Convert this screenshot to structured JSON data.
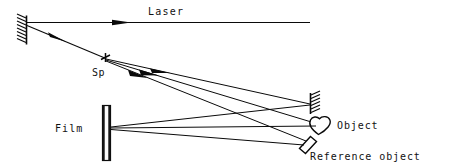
{
  "diagram": {
    "type": "optical-ray-diagram",
    "background_color": "#ffffff",
    "ink_color": "#0a0a0a",
    "labels": {
      "laser": "Laser",
      "splitter": "Sp",
      "film": "Film",
      "object": "Object",
      "reference_object": "Reference object"
    },
    "components": [
      {
        "name": "mirror-left",
        "kind": "mirror",
        "x": 26,
        "y_top": 16,
        "y_bottom": 44,
        "hatch_side": "left"
      },
      {
        "name": "mirror-right",
        "kind": "mirror",
        "x": 311,
        "y_top": 93,
        "y_bottom": 114,
        "hatch_side": "right"
      },
      {
        "name": "beam-splitter",
        "kind": "splitter",
        "x": 105,
        "y": 58
      },
      {
        "name": "film-plate",
        "kind": "film",
        "x": 102,
        "y_top": 105,
        "y_bottom": 161,
        "width": 8
      },
      {
        "name": "object",
        "kind": "blob",
        "x": 320,
        "y": 126
      },
      {
        "name": "reference-object",
        "kind": "tilted-plate",
        "x": 306,
        "y": 144
      }
    ],
    "rays": [
      {
        "name": "laser-beam",
        "from": "laser-source-right",
        "to": "mirror-left",
        "arrow": true
      },
      {
        "name": "mirror-to-splitter",
        "from": "mirror-left",
        "to": "beam-splitter",
        "arrow": true
      },
      {
        "name": "splitter-to-mirror-right",
        "from": "beam-splitter",
        "to": "mirror-right",
        "arrow": true
      },
      {
        "name": "splitter-to-object",
        "from": "beam-splitter",
        "to": "object",
        "arrow": true
      },
      {
        "name": "splitter-to-reference",
        "from": "beam-splitter",
        "to": "reference-object",
        "arrow": false
      },
      {
        "name": "mirror-right-to-film",
        "from": "mirror-right",
        "to": "film-plate",
        "arrow": false
      },
      {
        "name": "object-to-film",
        "from": "object",
        "to": "film-plate",
        "arrow": false
      },
      {
        "name": "reference-to-film",
        "from": "reference-object",
        "to": "film-plate",
        "arrow": false
      }
    ]
  }
}
